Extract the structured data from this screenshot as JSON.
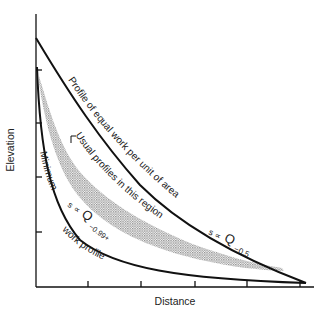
{
  "figure": {
    "xlabel": "Distance",
    "ylabel": "Elevation",
    "curves": {
      "equal_work": {
        "label": "Profile of equal work per unit of area",
        "formula_s": "s",
        "formula_prop": "∝",
        "formula_q": "Q",
        "formula_exp": "−0.5"
      },
      "minimum_work": {
        "label_line1": "Minimum",
        "label_line2": "work profile",
        "formula_s": "s",
        "formula_prop": "∝",
        "formula_q": "Q",
        "formula_exp": "−0.99+"
      },
      "usual_region": {
        "label": "Usual profiles in this region"
      }
    },
    "colors": {
      "line": "#111111",
      "shading": "#9a9a9a",
      "background": "#ffffff"
    },
    "x_ticks": 5,
    "y_ticks": 4
  }
}
